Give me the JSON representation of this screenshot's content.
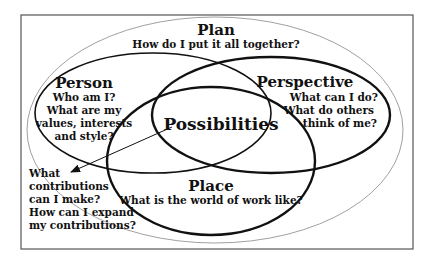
{
  "diagram": {
    "plan": {
      "title": "Plan",
      "question": "How do I put it all together?"
    },
    "person": {
      "title": "Person",
      "lines": [
        "Who am I?",
        "What are my",
        "values, interests",
        "and style?"
      ]
    },
    "perspective": {
      "title": "Perspective",
      "lines": [
        "What can I do?",
        "What do others",
        "think of me?"
      ]
    },
    "place": {
      "title": "Place",
      "question": "What is the world of work like?"
    },
    "center": {
      "title": "Possibilities"
    },
    "callout": {
      "lines": [
        "What",
        "contributions",
        "can I make?",
        "How can I expand",
        "my contributions?"
      ]
    }
  }
}
